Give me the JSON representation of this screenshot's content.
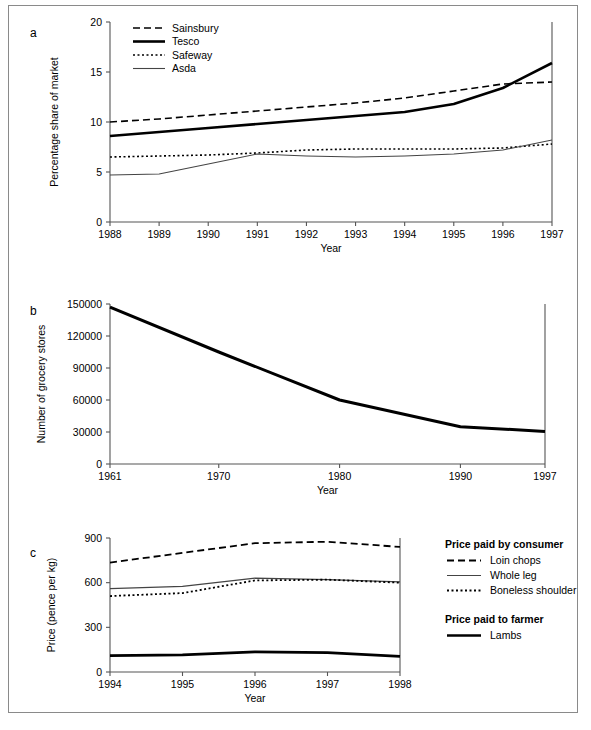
{
  "figure": {
    "panels": [
      "a",
      "b",
      "c"
    ]
  },
  "chart_data": [
    {
      "id": "panel-a",
      "panel_letter": "a",
      "type": "line",
      "title": "",
      "xlabel": "Year",
      "ylabel": "Percentage share of market",
      "x": [
        1988,
        1989,
        1990,
        1991,
        1992,
        1993,
        1994,
        1995,
        1996,
        1997
      ],
      "xticks": [
        "1988",
        "1989",
        "1990",
        "1991",
        "1992",
        "1993",
        "1994",
        "1995",
        "1996",
        "1997"
      ],
      "yticks": [
        "0",
        "5",
        "10",
        "15",
        "20"
      ],
      "xlim": [
        1988,
        1997
      ],
      "ylim": [
        0,
        20
      ],
      "grid": false,
      "legend_position": "top-left",
      "series": [
        {
          "name": "Sainsbury",
          "style": "dashed",
          "width": 1.6,
          "values": [
            10.0,
            10.3,
            10.7,
            11.1,
            11.5,
            11.9,
            12.4,
            13.1,
            13.8,
            14.0
          ]
        },
        {
          "name": "Tesco",
          "style": "solid-thick",
          "width": 2.6,
          "values": [
            8.6,
            9.0,
            9.4,
            9.8,
            10.2,
            10.6,
            11.0,
            11.8,
            13.4,
            15.9
          ]
        },
        {
          "name": "Safeway",
          "style": "dotted",
          "width": 1.6,
          "values": [
            6.5,
            6.6,
            6.7,
            6.9,
            7.2,
            7.3,
            7.3,
            7.3,
            7.4,
            7.8
          ]
        },
        {
          "name": "Asda",
          "style": "solid-thin",
          "width": 1.1,
          "values": [
            4.7,
            4.8,
            5.8,
            6.8,
            6.6,
            6.5,
            6.6,
            6.8,
            7.2,
            8.2
          ]
        }
      ]
    },
    {
      "id": "panel-b",
      "panel_letter": "b",
      "type": "line",
      "title": "",
      "xlabel": "Year",
      "ylabel": "Number of grocery stores",
      "x": [
        1961,
        1970,
        1980,
        1990,
        1997
      ],
      "xticks": [
        "1961",
        "1970",
        "1980",
        "1990",
        "1997"
      ],
      "yticks": [
        "0",
        "30000",
        "60000",
        "90000",
        "120000",
        "150000"
      ],
      "xlim": [
        1961,
        1997
      ],
      "ylim": [
        0,
        150000
      ],
      "grid": false,
      "legend_position": "none",
      "series": [
        {
          "name": "Number of grocery stores",
          "style": "solid-thick",
          "width": 3.0,
          "values": [
            147000,
            105000,
            60000,
            35000,
            30500
          ]
        }
      ]
    },
    {
      "id": "panel-c",
      "panel_letter": "c",
      "type": "line",
      "title": "",
      "xlabel": "Year",
      "ylabel": "Price (pence per kg)",
      "x": [
        1994,
        1995,
        1996,
        1997,
        1998
      ],
      "xticks": [
        "1994",
        "1995",
        "1996",
        "1997",
        "1998"
      ],
      "yticks": [
        "0",
        "300",
        "600",
        "900"
      ],
      "xlim": [
        1994,
        1998
      ],
      "ylim": [
        0,
        900
      ],
      "grid": false,
      "legend_position": "right",
      "legend_groups": [
        {
          "heading": "Price paid by consumer",
          "items": [
            "Loin chops",
            "Whole leg",
            "Boneless shoulder"
          ]
        },
        {
          "heading": "Price paid to farmer",
          "items": [
            "Lambs"
          ]
        }
      ],
      "series": [
        {
          "name": "Loin chops",
          "style": "dashed",
          "width": 1.8,
          "values": [
            735,
            800,
            865,
            875,
            840
          ]
        },
        {
          "name": "Whole leg",
          "style": "solid-thin",
          "width": 1.2,
          "values": [
            560,
            575,
            630,
            620,
            605
          ]
        },
        {
          "name": "Boneless shoulder",
          "style": "dotted",
          "width": 1.8,
          "values": [
            510,
            530,
            615,
            620,
            600
          ]
        },
        {
          "name": "Lambs",
          "style": "solid-thick",
          "width": 2.6,
          "values": [
            110,
            115,
            135,
            130,
            105
          ]
        }
      ]
    }
  ]
}
